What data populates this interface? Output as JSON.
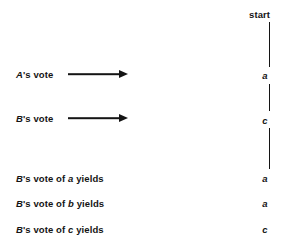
{
  "figure": {
    "background_color": "#ffffff",
    "ink_color": "#141414"
  },
  "timeline": {
    "start_label": "start",
    "axis_x": 269,
    "segments": [
      {
        "name": "start-to-a",
        "top": 22,
        "height": 45
      },
      {
        "name": "a-to-c",
        "top": 84,
        "height": 27
      },
      {
        "name": "c-to-end",
        "top": 128,
        "height": 41
      }
    ],
    "states": [
      {
        "name": "state-a",
        "label": "a",
        "y": 75
      },
      {
        "name": "state-c",
        "label": "c",
        "y": 120
      }
    ]
  },
  "events": [
    {
      "id": "a-vote",
      "actor": "A",
      "label_prefix": "A",
      "label_rest": "'s vote",
      "y": 74,
      "arrow": {
        "x": 68,
        "length": 60
      },
      "result": "a"
    },
    {
      "id": "b-vote",
      "actor": "B",
      "label_prefix": "B",
      "label_rest": "'s vote",
      "y": 118,
      "arrow": {
        "x": 68,
        "length": 60
      },
      "result": "c"
    }
  ],
  "outcomes": [
    {
      "id": "b-vote-of-a",
      "prefix": "B",
      "mid": "'s vote of ",
      "var": "a",
      "suffix": " yields",
      "result": "a",
      "y": 178
    },
    {
      "id": "b-vote-of-b",
      "prefix": "B",
      "mid": "'s vote of ",
      "var": "b",
      "suffix": " yields",
      "result": "a",
      "y": 203
    },
    {
      "id": "b-vote-of-c",
      "prefix": "B",
      "mid": "'s vote of ",
      "var": "c",
      "suffix": " yields",
      "result": "c",
      "y": 229
    }
  ]
}
